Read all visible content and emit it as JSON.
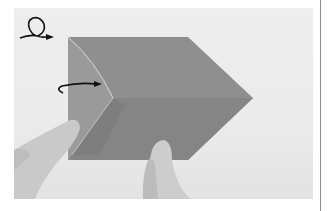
{
  "figure": {
    "icons": {
      "turn_over": "turn-over-icon",
      "fold_arrow": "fold-arrow-icon"
    },
    "colors": {
      "paper": "#8f8f8f",
      "paper_shadow": "#7c7c7c",
      "background": "#ececec",
      "skin": "#c8c8c8",
      "arrow": "#111111"
    }
  }
}
